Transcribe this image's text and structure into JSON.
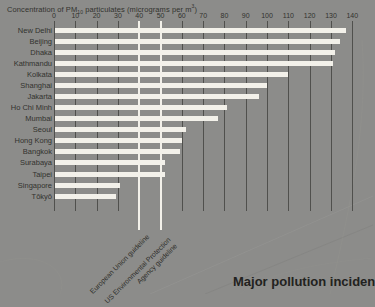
{
  "title": {
    "prefix": "Concentration of PM",
    "sub": "10",
    "mid": " particulates (micrograms per m",
    "sup": "3",
    "suffix": ")"
  },
  "caption": "Major pollution inciden",
  "chart_data": {
    "type": "bar",
    "orientation": "horizontal",
    "title": "Concentration of PM10 particulates (micrograms per m3)",
    "xlabel": "micrograms per m3",
    "ylabel": "",
    "xlim": [
      0,
      140
    ],
    "x_ticks": [
      0,
      10,
      20,
      30,
      40,
      50,
      60,
      70,
      80,
      90,
      100,
      110,
      120,
      130,
      140
    ],
    "grid": "vertical",
    "categories": [
      "New Delhi",
      "Beijing",
      "Dhaka",
      "Kathmandu",
      "Kolkata",
      "Shanghai",
      "Jakarta",
      "Ho Chi Minh",
      "Mumbai",
      "Seoul",
      "Hong Kong",
      "Bangkok",
      "Surabaya",
      "Taipei",
      "Singapore",
      "Tōkyō"
    ],
    "values": [
      137,
      134,
      132,
      131,
      110,
      100,
      96,
      81,
      77,
      62,
      60,
      59,
      52,
      52,
      31,
      29
    ],
    "reference_lines": [
      {
        "value": 40,
        "label_lines": [
          "European Union guideline"
        ]
      },
      {
        "value": 50,
        "label_lines": [
          "US Environmental Protection",
          "Agency guideline"
        ]
      }
    ]
  },
  "colors": {
    "background": "#8c8c8a",
    "bar": "#f3f1ea",
    "grid_line": "#50504d",
    "reference_line": "#f3f1ea",
    "text": "#32322e",
    "caption_text": "#222220"
  }
}
